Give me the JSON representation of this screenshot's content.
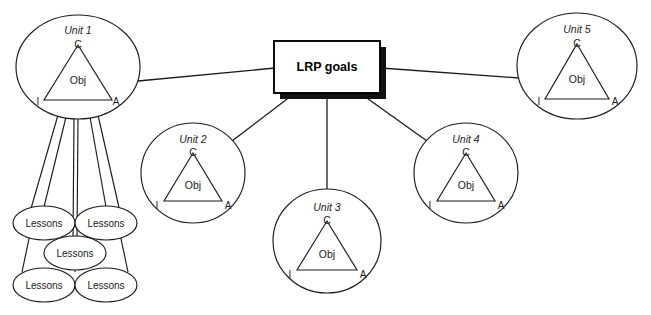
{
  "diagram": {
    "center_node": {
      "label": "LRP goals",
      "shape": "rectangle-with-drop-shadow",
      "x": 274,
      "y": 41,
      "width": 106,
      "height": 52,
      "shadow_offset": 6,
      "fill": "#ffffff",
      "stroke": "#000000",
      "shadow_color": "#111111"
    },
    "unit_label_parts": {
      "apex": "C",
      "left_corner": "I",
      "right_corner": "A",
      "inner": "Obj"
    },
    "units": [
      {
        "id": "unit-1",
        "label": "Unit 1",
        "apex": "C",
        "inner": "Obj",
        "left_corner": "I",
        "right_corner": "A",
        "cx": 78,
        "cy": 67,
        "rx": 62,
        "ry": 52
      },
      {
        "id": "unit-2",
        "label": "Unit 2",
        "apex": "C",
        "inner": "Obj",
        "left_corner": "I",
        "right_corner": "A",
        "cx": 193,
        "cy": 173,
        "rx": 52,
        "ry": 50
      },
      {
        "id": "unit-3",
        "label": "Unit 3",
        "apex": "C",
        "inner": "Obj",
        "left_corner": "I",
        "right_corner": "A",
        "cx": 327,
        "cy": 241,
        "rx": 54,
        "ry": 52
      },
      {
        "id": "unit-4",
        "label": "Unit 4",
        "apex": "C",
        "inner": "Obj",
        "left_corner": "I",
        "right_corner": "A",
        "cx": 466,
        "cy": 173,
        "rx": 52,
        "ry": 50
      },
      {
        "id": "unit-5",
        "label": "Unit 5",
        "apex": "C",
        "inner": "Obj",
        "left_corner": "I",
        "right_corner": "A",
        "cx": 577,
        "cy": 66,
        "rx": 60,
        "ry": 53
      }
    ],
    "lessons": [
      {
        "id": "lesson-1",
        "label": "Lessons",
        "cx": 44,
        "cy": 223,
        "rx": 31,
        "ry": 17
      },
      {
        "id": "lesson-2",
        "label": "Lessons",
        "cx": 106,
        "cy": 223,
        "rx": 31,
        "ry": 17
      },
      {
        "id": "lesson-3",
        "label": "Lessons",
        "cx": 75,
        "cy": 253,
        "rx": 31,
        "ry": 17
      },
      {
        "id": "lesson-4",
        "label": "Lessons",
        "cx": 44,
        "cy": 285,
        "rx": 31,
        "ry": 17
      },
      {
        "id": "lesson-5",
        "label": "Lessons",
        "cx": 106,
        "cy": 285,
        "rx": 31,
        "ry": 17
      }
    ],
    "connectors": [
      {
        "id": "link-unit1-goals",
        "from": "unit-1",
        "to": "center-node",
        "x1": 140,
        "y1": 81,
        "x2": 274,
        "y2": 68
      },
      {
        "id": "link-unit5-goals",
        "from": "unit-5",
        "to": "center-node",
        "x1": 380,
        "y1": 68,
        "x2": 518,
        "y2": 78
      },
      {
        "id": "link-unit2-goals",
        "from": "unit-2",
        "to": "center-node",
        "x1": 231,
        "y1": 140,
        "x2": 292,
        "y2": 96
      },
      {
        "id": "link-unit3-goals",
        "from": "unit-3",
        "to": "center-node",
        "x1": 327,
        "y1": 189,
        "x2": 327,
        "y2": 96
      },
      {
        "id": "link-unit4-goals",
        "from": "unit-4",
        "to": "center-node",
        "x1": 428,
        "y1": 140,
        "x2": 363,
        "y2": 96
      }
    ],
    "lesson_connectors": [
      {
        "id": "lesson-link-1",
        "from": "unit-1",
        "to": "lesson-1"
      },
      {
        "id": "lesson-link-2",
        "from": "unit-1",
        "to": "lesson-2"
      },
      {
        "id": "lesson-link-3",
        "from": "unit-1",
        "to": "lesson-3"
      },
      {
        "id": "lesson-link-4",
        "from": "unit-1",
        "to": "lesson-4"
      },
      {
        "id": "lesson-link-5",
        "from": "unit-1",
        "to": "lesson-5"
      }
    ],
    "colors": {
      "background": "#ffffff",
      "stroke": "#1b1b1b",
      "box_stroke": "#000000",
      "shadow": "#111111",
      "text": "#1b1b1b"
    }
  }
}
